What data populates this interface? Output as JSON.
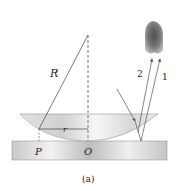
{
  "diagram": {
    "caption": "(a)",
    "labels": {
      "radius": "R",
      "small_radius": "r",
      "point_p": "P",
      "point_o": "O",
      "ray_1": "1",
      "ray_2": "2"
    },
    "elements": [
      "plano-convex lens",
      "flat glass plate",
      "incident ray",
      "reflected ray 1",
      "reflected ray 2",
      "eye / observer"
    ]
  }
}
